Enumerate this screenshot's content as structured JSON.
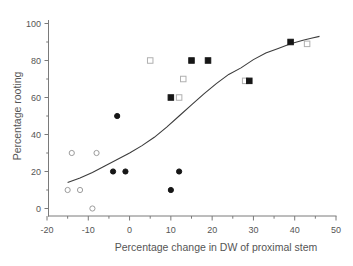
{
  "figure": {
    "background": "#ffffff"
  },
  "chart_data": {
    "type": "scatter",
    "title": "",
    "xlabel": "Percentage change in DW of proximal stem",
    "ylabel": "Percentage rooting",
    "xlim": [
      -20,
      50
    ],
    "ylim": [
      0,
      100
    ],
    "x_ticks_major": [
      -20,
      -10,
      0,
      10,
      20,
      30,
      40,
      50
    ],
    "x_ticks_minor": [
      -15,
      -5,
      5,
      15,
      25,
      35,
      45
    ],
    "y_ticks_major": [
      0,
      20,
      40,
      60,
      80,
      100
    ],
    "y_ticks_minor": [
      10,
      30,
      50,
      70,
      90
    ],
    "grid": false,
    "legend": "none",
    "axis_color": "#7a7a7a",
    "series": [
      {
        "name": "open-circle",
        "marker": "circle",
        "fill": "open",
        "color": "#9c9c9c",
        "points": [
          [
            -14,
            30
          ],
          [
            -8,
            30
          ],
          [
            -15,
            10
          ],
          [
            -12,
            10
          ],
          [
            -9,
            0
          ]
        ]
      },
      {
        "name": "filled-circle",
        "marker": "circle",
        "fill": "solid",
        "color": "#161616",
        "points": [
          [
            -4,
            20
          ],
          [
            -1,
            20
          ],
          [
            -3,
            50
          ],
          [
            12,
            20
          ],
          [
            10,
            10
          ]
        ]
      },
      {
        "name": "open-square",
        "marker": "square",
        "fill": "open",
        "color": "#b0b0b0",
        "points": [
          [
            5,
            80
          ],
          [
            13,
            70
          ],
          [
            12,
            60
          ],
          [
            28,
            69
          ],
          [
            43,
            89
          ]
        ]
      },
      {
        "name": "filled-square",
        "marker": "square",
        "fill": "solid",
        "color": "#161616",
        "points": [
          [
            15,
            80
          ],
          [
            19,
            80
          ],
          [
            10,
            60
          ],
          [
            29,
            69
          ],
          [
            39,
            90
          ]
        ]
      }
    ],
    "fit_curve": {
      "name": "sigmoid-fit",
      "color": "#3c3c3c",
      "points": [
        [
          -15,
          14
        ],
        [
          -12,
          16.5
        ],
        [
          -9,
          19.5
        ],
        [
          -6,
          23
        ],
        [
          -3,
          26.5
        ],
        [
          0,
          30
        ],
        [
          3,
          34
        ],
        [
          6,
          38.5
        ],
        [
          9,
          44
        ],
        [
          12,
          50
        ],
        [
          15,
          56
        ],
        [
          18,
          62
        ],
        [
          21,
          67.5
        ],
        [
          24,
          72.5
        ],
        [
          27,
          76
        ],
        [
          30,
          80.5
        ],
        [
          33,
          84
        ],
        [
          36,
          86.5
        ],
        [
          39,
          89
        ],
        [
          42,
          91
        ],
        [
          44,
          92
        ],
        [
          46,
          93
        ]
      ]
    }
  }
}
